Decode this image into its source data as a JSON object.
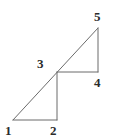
{
  "figure": {
    "stroke_color": "#6b6b6b",
    "stroke_width": 1,
    "background_color": "#ffffff",
    "label_color": "#2b2b2b",
    "width": 113,
    "height": 140,
    "vertices": [
      {
        "id": "1",
        "label": "1",
        "x": 13,
        "y": 120,
        "role": "lower-triangle-bottom-left"
      },
      {
        "id": "2",
        "label": "2",
        "x": 57,
        "y": 120,
        "role": "lower-triangle-bottom-right"
      },
      {
        "id": "3",
        "label": "3",
        "x": 57,
        "y": 72,
        "role": "shared-midpoint-on-hypotenuse"
      },
      {
        "id": "4",
        "label": "4",
        "x": 98,
        "y": 72,
        "role": "upper-triangle-bottom-right"
      },
      {
        "id": "5",
        "label": "5",
        "x": 98,
        "y": 28,
        "role": "upper-triangle-top"
      }
    ],
    "segments": [
      {
        "name": "hypotenuse-1-to-5",
        "from": "1",
        "to": "5",
        "x1": 13,
        "y1": 120,
        "x2": 98,
        "y2": 28
      },
      {
        "name": "lower-base-1-to-2",
        "from": "1",
        "to": "2",
        "x1": 13,
        "y1": 120,
        "x2": 57,
        "y2": 120
      },
      {
        "name": "lower-vertical-2-to-3",
        "from": "2",
        "to": "3",
        "x1": 57,
        "y1": 120,
        "x2": 57,
        "y2": 72
      },
      {
        "name": "upper-base-3-to-4",
        "from": "3",
        "to": "4",
        "x1": 57,
        "y1": 72,
        "x2": 98,
        "y2": 72
      },
      {
        "name": "upper-vertical-4-to-5",
        "from": "4",
        "to": "5",
        "x1": 98,
        "y1": 72,
        "x2": 98,
        "y2": 28
      }
    ]
  }
}
